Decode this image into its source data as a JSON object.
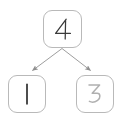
{
  "diagram": {
    "type": "tree",
    "title": "",
    "canvas": {
      "width": 122,
      "height": 122,
      "background": "#ffffff"
    },
    "style": {
      "node_border_color": "#b9b9b9",
      "node_fill_color": "#ffffff",
      "edge_color": "#9a9a9a",
      "glyph_dark_color": "#3a3a3a",
      "glyph_light_color": "#b0b0b0",
      "node_corner_radius": 9
    },
    "nodes": [
      {
        "id": "root",
        "label": "4",
        "role": "parent",
        "glyph_style": "handwritten",
        "glyph_color": "#3a3a3a",
        "x": 43,
        "y": 10,
        "width": 39,
        "height": 38
      },
      {
        "id": "left",
        "label": "1",
        "role": "child",
        "glyph_style": "handwritten",
        "glyph_color": "#2e2e2e",
        "x": 8,
        "y": 75,
        "width": 38,
        "height": 38
      },
      {
        "id": "right",
        "label": "3",
        "role": "child",
        "glyph_style": "handwritten",
        "glyph_color": "#b0b0b0",
        "x": 76,
        "y": 75,
        "width": 38,
        "height": 38
      }
    ],
    "edges": [
      {
        "id": "root-to-left",
        "from": "root",
        "to": "left",
        "label": "",
        "arrowhead": "filled-triangle",
        "start": [
          62,
          48
        ],
        "end": [
          31,
          71
        ]
      },
      {
        "id": "root-to-right",
        "from": "root",
        "to": "right",
        "label": "",
        "arrowhead": "filled-triangle",
        "start": [
          62,
          48
        ],
        "end": [
          92,
          71
        ]
      }
    ]
  }
}
